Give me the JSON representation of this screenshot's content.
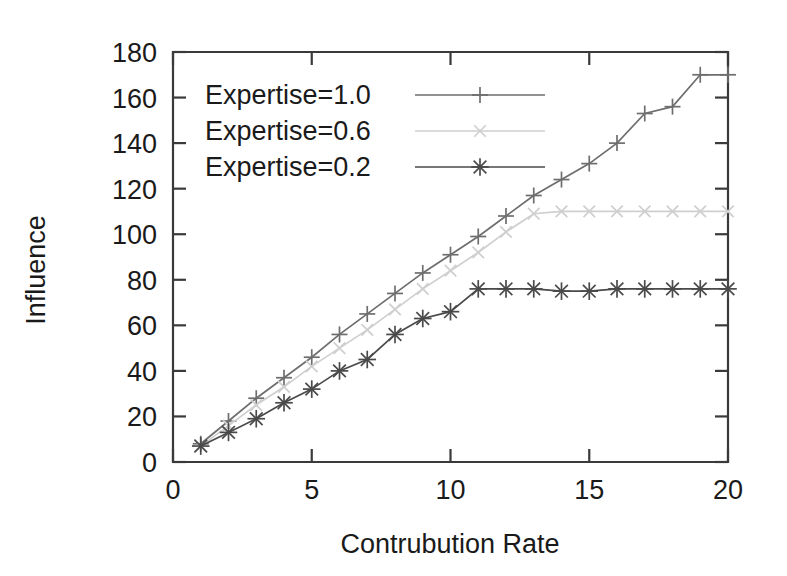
{
  "chart_data": {
    "type": "line",
    "title": "",
    "xlabel": "Contrubution Rate",
    "ylabel": "Influence",
    "xlim": [
      0,
      20
    ],
    "ylim": [
      0,
      180
    ],
    "xticks": [
      0,
      5,
      10,
      15,
      20
    ],
    "yticks": [
      0,
      20,
      40,
      60,
      80,
      100,
      120,
      140,
      160,
      180
    ],
    "grid": false,
    "legend_position": "top-left-inside",
    "x": [
      1,
      2,
      3,
      4,
      5,
      6,
      7,
      8,
      9,
      10,
      11,
      12,
      13,
      14,
      15,
      16,
      17,
      18,
      19,
      20
    ],
    "series": [
      {
        "name": "Expertise=1.0",
        "marker": "plus",
        "color": "#6e6e6e",
        "values": [
          8,
          18,
          28,
          37,
          46,
          56,
          65,
          74,
          83,
          91,
          99,
          108,
          117,
          124,
          131,
          140,
          153,
          156,
          170,
          170
        ]
      },
      {
        "name": "Expertise=0.6",
        "marker": "cross",
        "color": "#cfcfcf",
        "values": [
          7,
          16,
          25,
          33,
          42,
          50,
          58,
          67,
          76,
          84,
          92,
          101,
          109,
          110,
          110,
          110,
          110,
          110,
          110,
          110
        ]
      },
      {
        "name": "Expertise=0.2",
        "marker": "star",
        "color": "#4a4a4a",
        "values": [
          7,
          13,
          19,
          26,
          32,
          40,
          45,
          56,
          63,
          66,
          76,
          76,
          76,
          75,
          75,
          76,
          76,
          76,
          76,
          76
        ]
      }
    ]
  },
  "legend": {
    "entries": [
      {
        "label": "Expertise=1.0"
      },
      {
        "label": "Expertise=0.6"
      },
      {
        "label": "Expertise=0.2"
      }
    ]
  },
  "axis_labels": {
    "x": "Contrubution Rate",
    "y": "Influence"
  },
  "xtick_labels": [
    "0",
    "5",
    "10",
    "15",
    "20"
  ],
  "ytick_labels": [
    "0",
    "20",
    "40",
    "60",
    "80",
    "100",
    "120",
    "140",
    "160",
    "180"
  ]
}
